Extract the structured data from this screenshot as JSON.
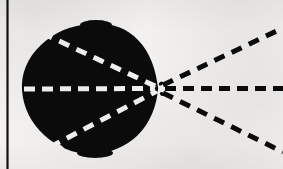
{
  "figure": {
    "title": "Scanned diagram: dark lobe with converging dashed axes and diverging dashed rays",
    "canvas": {
      "width": 283,
      "height": 169
    },
    "colors": {
      "background": "#f2f1ef",
      "ink": "#0b0b0b",
      "dash_light": "#f4f3f1",
      "margin_rule": "#111111"
    },
    "margin_rule": {
      "label": "left margin rule",
      "x": 7.5,
      "y_top": 0,
      "y_bottom": 169,
      "width": 2.2
    },
    "lobe": {
      "label": "solid black lobe",
      "fill": "#0b0b0b",
      "center_x": 88,
      "center_y": 89,
      "path": "M 158 88 C 156 70 150 52 138 40 C 126 27 108 22 90 24 C 72 25 54 32 41 45 C 27 58 21 74 22 90 C 23 107 31 123 44 135 C 57 147 74 154 91 154 C 108 154 126 147 138 135 C 150 123 157 106 158 88 Z",
      "notches": [
        {
          "label": "top-left notch",
          "cx": 49,
          "cy": 33,
          "rx": 6,
          "ry": 4,
          "rot": -28
        },
        {
          "label": "bottom-left notch",
          "cx": 58,
          "cy": 147,
          "rx": 6,
          "ry": 4,
          "rot": 26
        },
        {
          "label": "right-lower nick",
          "cx": 150,
          "cy": 131,
          "rx": 5,
          "ry": 4,
          "rot": 40
        }
      ]
    },
    "vertex": {
      "label": "convergence point",
      "x": 159,
      "y": 88.5
    },
    "inner_dashed_lines": [
      {
        "name": "inner-axis-horizontal",
        "color": "#f4f3f1",
        "x1": 24,
        "y1": 89,
        "x2": 157,
        "y2": 88.5,
        "stroke_width": 5,
        "dash": "11 7"
      },
      {
        "name": "inner-axis-upper",
        "color": "#f4f3f1",
        "x1": 42,
        "y1": 33,
        "x2": 157,
        "y2": 87,
        "stroke_width": 5,
        "dash": "11 8"
      },
      {
        "name": "inner-axis-lower",
        "color": "#f4f3f1",
        "x1": 50,
        "y1": 147,
        "x2": 157,
        "y2": 91,
        "stroke_width": 5,
        "dash": "11 8"
      }
    ],
    "outer_dashed_rays": [
      {
        "name": "ray-upper",
        "color": "#0b0b0b",
        "x1": 163,
        "y1": 85,
        "x2": 283,
        "y2": 28,
        "stroke_width": 5,
        "dash": "11 8"
      },
      {
        "name": "ray-horizontal",
        "color": "#0b0b0b",
        "x1": 165,
        "y1": 88.5,
        "x2": 283,
        "y2": 88.5,
        "stroke_width": 5,
        "dash": "11 7"
      },
      {
        "name": "ray-lower",
        "color": "#0b0b0b",
        "x1": 163,
        "y1": 93,
        "x2": 283,
        "y2": 152,
        "stroke_width": 5,
        "dash": "11 8"
      }
    ],
    "vertex_flecks": [
      {
        "cx": 160.5,
        "cy": 83.5,
        "rx": 2.2,
        "ry": 1.8,
        "rot": -35
      },
      {
        "cx": 161.5,
        "cy": 94.0,
        "rx": 2.2,
        "ry": 1.8,
        "rot": 35
      },
      {
        "cx": 157.0,
        "cy": 88.5,
        "rx": 1.6,
        "ry": 2.4,
        "rot": 0
      }
    ]
  }
}
